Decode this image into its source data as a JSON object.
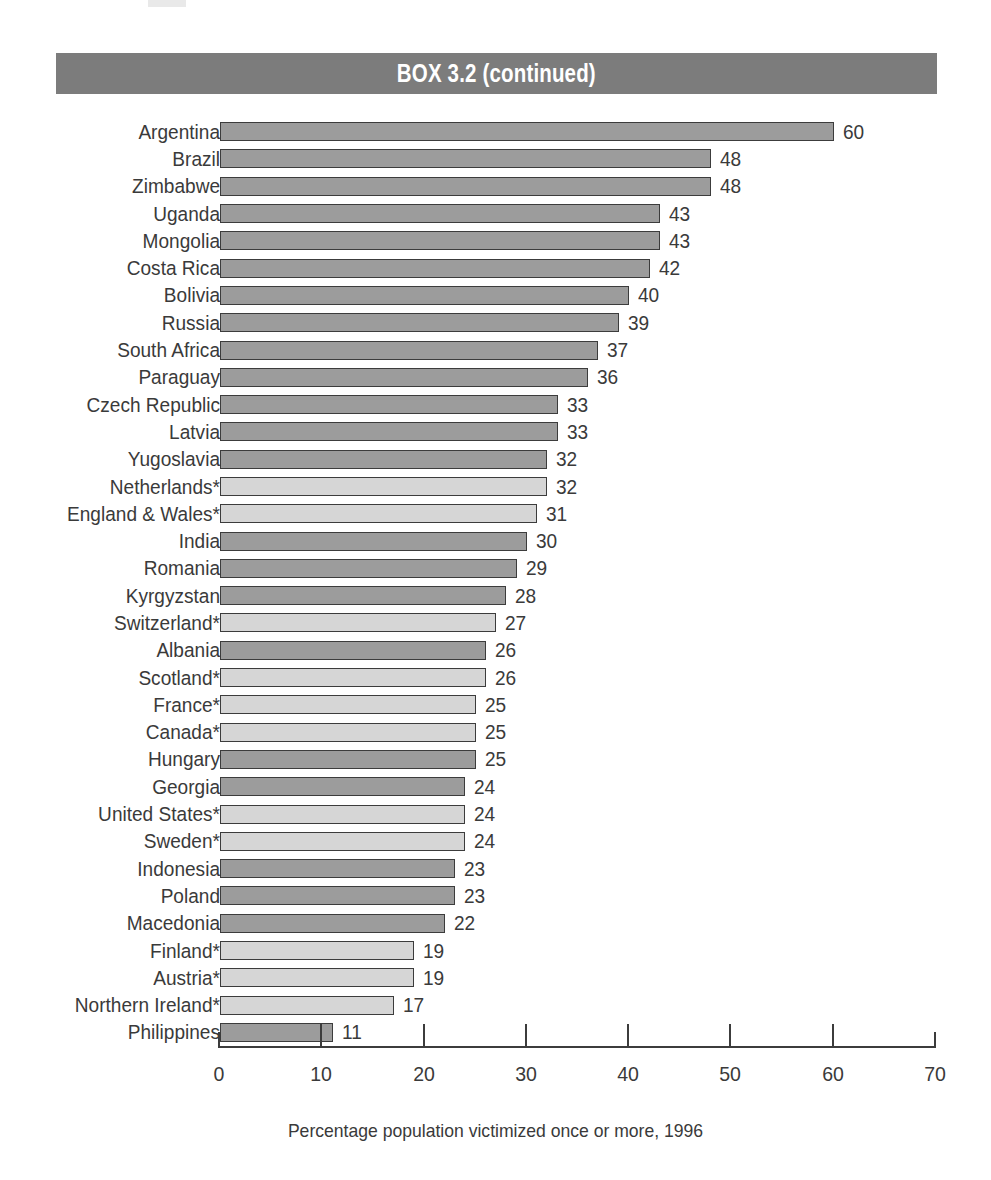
{
  "header": {
    "title": "BOX 3.2 (continued)"
  },
  "caption": "Percentage population victimized once or more, 1996",
  "colors": {
    "header_band": "#7c7c7c",
    "bar_dark": "#9c9c9c",
    "bar_light": "#d6d6d6",
    "bar_outline": "#3c3c3c",
    "text": "#3a3a3a"
  },
  "chart_data": {
    "type": "bar",
    "orientation": "horizontal",
    "title": "BOX 3.2 (continued)",
    "xlabel": "Percentage population victimized once or more, 1996",
    "ylabel": "",
    "xlim": [
      0,
      70
    ],
    "xticks": [
      0,
      10,
      20,
      30,
      40,
      50,
      60,
      70
    ],
    "xtick_labels": [
      "0",
      "10",
      "20",
      "30",
      "40",
      "50",
      "60",
      "70"
    ],
    "grid": false,
    "legend": "none",
    "categories": [
      "Argentina",
      "Brazil",
      "Zimbabwe",
      "Uganda",
      "Mongolia",
      "Costa Rica",
      "Bolivia",
      "Russia",
      "South Africa",
      "Paraguay",
      "Czech Republic",
      "Latvia",
      "Yugoslavia",
      "Netherlands*",
      "England & Wales*",
      "India",
      "Romania",
      "Kyrgyzstan",
      "Switzerland*",
      "Albania",
      "Scotland*",
      "France*",
      "Canada*",
      "Hungary",
      "Georgia",
      "United States*",
      "Sweden*",
      "Indonesia",
      "Poland",
      "Macedonia",
      "Finland*",
      "Austria*",
      "Northern Ireland*",
      "Philippines"
    ],
    "values": [
      60,
      48,
      48,
      43,
      43,
      42,
      40,
      39,
      37,
      36,
      33,
      33,
      32,
      32,
      31,
      30,
      29,
      28,
      27,
      26,
      26,
      25,
      25,
      25,
      24,
      24,
      24,
      23,
      23,
      22,
      19,
      19,
      17,
      11
    ],
    "shades": [
      "dark",
      "dark",
      "dark",
      "dark",
      "dark",
      "dark",
      "dark",
      "dark",
      "dark",
      "dark",
      "dark",
      "dark",
      "dark",
      "light",
      "light",
      "dark",
      "dark",
      "dark",
      "light",
      "dark",
      "light",
      "light",
      "light",
      "dark",
      "dark",
      "light",
      "light",
      "dark",
      "dark",
      "dark",
      "light",
      "light",
      "light",
      "dark"
    ]
  }
}
